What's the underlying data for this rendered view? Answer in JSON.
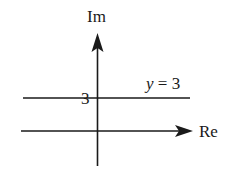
{
  "diagram": {
    "type": "complex-plane",
    "axes": {
      "horizontal": {
        "label": "Re",
        "arrow": true
      },
      "vertical": {
        "label": "Im",
        "arrow": true
      }
    },
    "tick_labels": [
      {
        "axis": "Im",
        "value": "3"
      }
    ],
    "lines": [
      {
        "equation_var": "y",
        "equation_op": " = ",
        "equation_val": "3",
        "orientation": "horizontal",
        "intercept": 3
      }
    ],
    "colors": {
      "stroke": "#1a1a1a",
      "background": "#ffffff"
    }
  }
}
